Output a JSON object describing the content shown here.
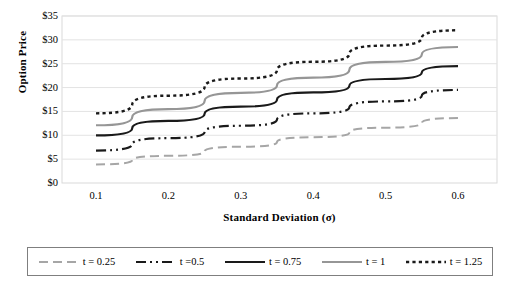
{
  "chart_data": {
    "type": "line",
    "title": "",
    "xlabel": "Standard Deviation (σ)",
    "ylabel": "Option Price",
    "x": [
      0.1,
      0.2,
      0.3,
      0.4,
      0.5,
      0.6
    ],
    "xlim": [
      0.05,
      0.65
    ],
    "ylim": [
      0,
      35
    ],
    "ytick_labels": [
      "$0",
      "$5",
      "$10",
      "$15",
      "$20",
      "$25",
      "$30",
      "$35"
    ],
    "ytick_values": [
      0,
      5,
      10,
      15,
      20,
      25,
      30,
      35
    ],
    "xtick_labels": [
      "0.1",
      "0.2",
      "0.3",
      "0.4",
      "0.5",
      "0.6"
    ],
    "grid": "horizontal",
    "legend_position": "bottom",
    "series": [
      {
        "name": "t = 0.25",
        "values": [
          3.9,
          5.7,
          7.6,
          9.6,
          11.6,
          13.6
        ],
        "color": "#a6a6a6",
        "style": "dashed",
        "dasharray": "9,5",
        "width": 2
      },
      {
        "name": "t =0.5",
        "values": [
          6.8,
          9.4,
          12.0,
          14.6,
          17.1,
          19.5
        ],
        "color": "#1a1a1a",
        "style": "dash-dot",
        "dasharray": "10,4,2,4,2,4",
        "width": 2.2
      },
      {
        "name": "t = 0.75",
        "values": [
          10.0,
          13.0,
          16.0,
          19.0,
          21.8,
          24.5
        ],
        "color": "#1a1a1a",
        "style": "solid",
        "dasharray": "",
        "width": 2.2
      },
      {
        "name": "t = 1",
        "values": [
          12.1,
          15.5,
          18.9,
          22.1,
          25.4,
          28.5
        ],
        "color": "#969696",
        "style": "solid",
        "dasharray": "",
        "width": 2.2
      },
      {
        "name": "t = 1.25",
        "values": [
          14.6,
          18.3,
          21.9,
          25.4,
          28.8,
          32.0
        ],
        "color": "#1a1a1a",
        "style": "dotted",
        "dasharray": "3.2,3.2",
        "width": 2.4
      }
    ]
  },
  "axes": {
    "plot_border_color": "#d9d9d9",
    "grid_color": "#e3e3e3"
  }
}
